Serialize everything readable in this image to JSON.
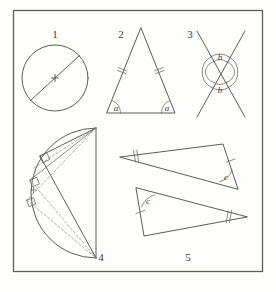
{
  "page": {
    "background_color": "#fdfdfc",
    "ink_color": "#4a4a4a",
    "width": 276,
    "height": 292
  },
  "frame": {
    "name": "outer-border",
    "x": 13,
    "y": 10,
    "width": 250,
    "height": 262
  },
  "figures": [
    {
      "number": "1",
      "number_pos": {
        "x": 55,
        "y": 36
      },
      "kind": "circle-with-diameter",
      "caption_labels": [],
      "circle": {
        "cx": 55,
        "cy": 78,
        "r": 33
      },
      "diameter": {
        "x1": 31,
        "y1": 101,
        "x2": 79,
        "y2": 55
      },
      "center_mark": {
        "x": 55,
        "y": 78,
        "size": 5
      }
    },
    {
      "number": "2",
      "number_pos": {
        "x": 121,
        "y": 36
      },
      "kind": "isosceles-triangle",
      "vertices": {
        "apex": {
          "x": 141,
          "y": 28
        },
        "base_left": {
          "x": 107,
          "y": 113
        },
        "base_right": {
          "x": 175,
          "y": 113
        }
      },
      "angle_labels": [
        {
          "text": "a",
          "x": 116,
          "y": 110
        },
        {
          "text": "a",
          "x": 167,
          "y": 110
        }
      ],
      "tick_marks": {
        "count": 2,
        "sides": [
          "left-leg",
          "right-leg"
        ]
      }
    },
    {
      "number": "3",
      "number_pos": {
        "x": 190,
        "y": 36
      },
      "kind": "vertical-angles-crossing-lines",
      "cross_center": {
        "x": 220,
        "y": 72
      },
      "lines": [
        {
          "x1": 196,
          "y1": 30,
          "x2": 246,
          "y2": 118
        },
        {
          "x1": 246,
          "y1": 30,
          "x2": 196,
          "y2": 118
        }
      ],
      "angle_labels": [
        {
          "text": "b",
          "x": 220,
          "y": 58
        },
        {
          "text": "b",
          "x": 220,
          "y": 91
        }
      ],
      "arc_count_per_angle": 2
    },
    {
      "number": "4",
      "number_pos": {
        "x": 100,
        "y": 257
      },
      "kind": "thales-semicircle-right-angles",
      "diameter": {
        "top": {
          "x": 96,
          "y": 128
        },
        "bottom": {
          "x": 96,
          "y": 258
        }
      },
      "arc_bulge": "left",
      "arc_points": [
        {
          "x": 40,
          "y": 156
        },
        {
          "x": 30,
          "y": 180
        },
        {
          "x": 27,
          "y": 200
        }
      ],
      "right_angle_marks": 3,
      "solid_chords": 2,
      "dashed_chords": 4
    },
    {
      "number": "5",
      "number_pos": {
        "x": 188,
        "y": 257
      },
      "kind": "congruent-triangles-pair",
      "triangle_upper": {
        "vertices": [
          {
            "x": 120,
            "y": 157
          },
          {
            "x": 223,
            "y": 144
          },
          {
            "x": 238,
            "y": 189
          }
        ],
        "angle_label": {
          "text": "c",
          "x": 224,
          "y": 178
        },
        "double_tick_side": "left-short",
        "single_tick_side": "right-upper"
      },
      "triangle_lower": {
        "vertices": [
          {
            "x": 247,
            "y": 217
          },
          {
            "x": 136,
            "y": 188
          },
          {
            "x": 144,
            "y": 236
          }
        ],
        "angle_label": {
          "text": "c",
          "x": 146,
          "y": 201
        },
        "double_tick_side": "right-short",
        "single_tick_side": "left-lower"
      }
    }
  ],
  "labels": {
    "fig1": "1",
    "fig2": "2",
    "fig3": "3",
    "fig4": "4",
    "fig5": "5",
    "angle_a_left": "a",
    "angle_a_right": "a",
    "angle_b_top": "b",
    "angle_b_bottom": "b",
    "angle_c_upper": "c",
    "angle_c_lower": "c"
  }
}
